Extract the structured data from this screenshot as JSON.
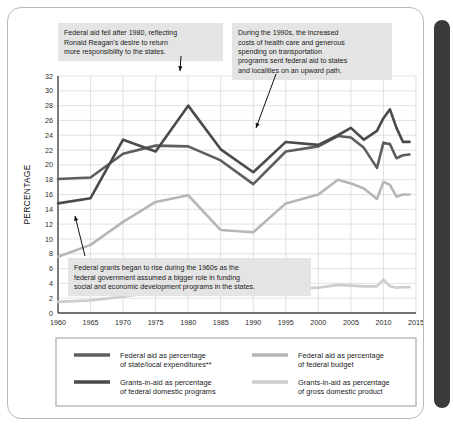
{
  "card": {
    "title": "federal-aid-trends-chart"
  },
  "scrollbar": {
    "name": "vertical-scrollbar"
  },
  "chart_data": {
    "type": "line",
    "title": "",
    "xlabel": "",
    "ylabel": "PERCENTAGE",
    "xlim": [
      1960,
      2015
    ],
    "ylim": [
      0,
      32
    ],
    "grid": true,
    "legend_position": "bottom",
    "xticks": [
      1960,
      1965,
      1970,
      1975,
      1980,
      1985,
      1990,
      1995,
      2000,
      2005,
      2010,
      2015
    ],
    "yticks": [
      0,
      2,
      4,
      6,
      8,
      10,
      12,
      14,
      16,
      18,
      20,
      22,
      24,
      26,
      28,
      30,
      32
    ],
    "x": [
      1960,
      1965,
      1970,
      1975,
      1980,
      1985,
      1990,
      1995,
      2000,
      2003,
      2005,
      2007,
      2009,
      2010,
      2011,
      2012,
      2013,
      2014
    ],
    "series": [
      {
        "name": "Federal aid as percentage of state/local expenditures**",
        "color": "#5e5e5e",
        "values": [
          18.1,
          18.3,
          21.5,
          22.6,
          22.5,
          20.6,
          17.4,
          21.8,
          22.5,
          23.9,
          23.7,
          22.3,
          19.6,
          23.0,
          22.8,
          20.9,
          21.3,
          21.4
        ]
      },
      {
        "name": "Grants-in-aid as percentage of federal domestic programs",
        "color": "#4a4a4a",
        "values": [
          14.8,
          15.5,
          23.4,
          21.8,
          28.0,
          22.1,
          19.0,
          23.1,
          22.7,
          24.0,
          25.0,
          23.4,
          24.6,
          26.3,
          27.5,
          25.0,
          23.1,
          23.1
        ]
      },
      {
        "name": "Federal aid as percentage of federal budget",
        "color": "#b6b6b6",
        "values": [
          7.6,
          9.2,
          12.3,
          15.0,
          15.9,
          11.2,
          10.9,
          14.8,
          16.0,
          18.0,
          17.5,
          16.8,
          15.4,
          17.7,
          17.3,
          15.7,
          16.0,
          16.0
        ]
      },
      {
        "name": "Grants-in-aid as percentage of gross domestic product",
        "color": "#cdcdcd",
        "values": [
          1.5,
          1.7,
          2.2,
          2.9,
          3.4,
          3.0,
          3.0,
          3.4,
          3.4,
          3.8,
          3.7,
          3.6,
          3.6,
          4.5,
          3.6,
          3.4,
          3.5,
          3.5
        ]
      }
    ],
    "annotations": [
      {
        "id": "annotation-reagan",
        "lines": [
          "Federal aid fell after 1980, reflecting",
          "Ronald Reagan's desire to return",
          "more responsibility to the states."
        ],
        "arrow_to_year": 1980,
        "arrow_to_value": 28.0
      },
      {
        "id": "annotation-nineties",
        "lines": [
          "During the 1990s, the increased",
          "costs of health care and generous",
          "spending on transportation",
          "programs sent federal aid to states",
          "and localities on an upward path."
        ],
        "arrow_to_year": 1993,
        "arrow_to_value": 21.0
      },
      {
        "id": "annotation-sixties",
        "lines": [
          "Federal grants began to rise during the 1960s as the",
          "federal government assumed a bigger role in funding",
          "social and economic development programs in the states."
        ],
        "arrow_to_year": 1965,
        "arrow_to_value": 15.5
      }
    ],
    "legend": [
      {
        "label_line1": "Federal aid as percentage",
        "label_line2": "of state/local expenditures**",
        "color": "#5e5e5e"
      },
      {
        "label_line1": "Federal aid as percentage",
        "label_line2": "of federal budget",
        "color": "#b6b6b6"
      },
      {
        "label_line1": "Grants-in-aid as percentage",
        "label_line2": "of federal domestic programs",
        "color": "#4a4a4a"
      },
      {
        "label_line1": "Grants-in-aid as percentage",
        "label_line2": "of gross domestic product",
        "color": "#cdcdcd"
      }
    ]
  }
}
